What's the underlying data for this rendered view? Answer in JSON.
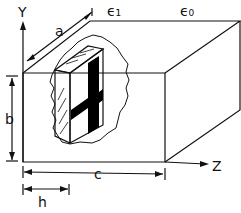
{
  "diagram": {
    "axes": {
      "y_label": "Y",
      "z_label": "Z"
    },
    "dielectrics": {
      "inner": "ϵ₁",
      "outer": "ϵ₀"
    },
    "dimensions": {
      "a": "a",
      "b": "b",
      "c": "c",
      "h": "h"
    },
    "colors": {
      "line": "#111111",
      "fill": "#000000",
      "background": "#ffffff"
    }
  }
}
